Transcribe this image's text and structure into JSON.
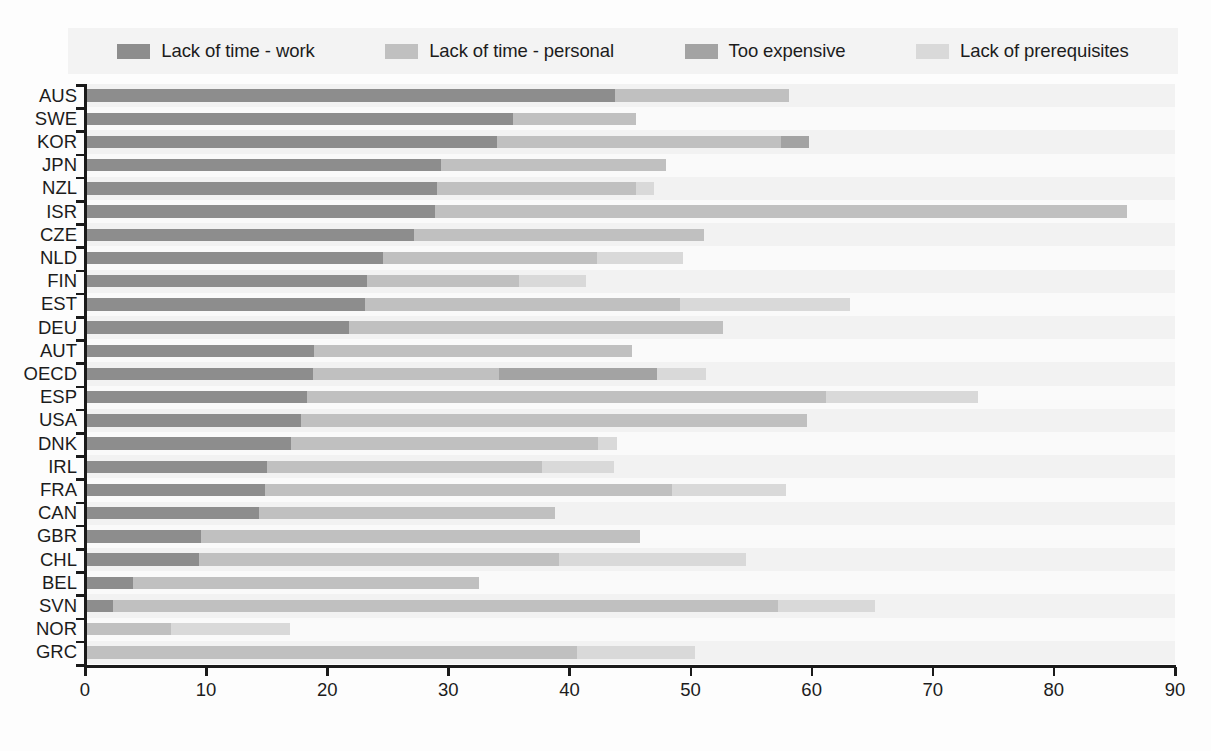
{
  "legend": {
    "items": [
      {
        "label": "Lack of time - work",
        "color": "#8d8d8d",
        "icon": "legend-swatch-icon"
      },
      {
        "label": "Lack of time - personal",
        "color": "#c0c0c0",
        "icon": "legend-swatch-icon"
      },
      {
        "label": "Too expensive",
        "color": "#a3a3a3",
        "icon": "legend-swatch-icon"
      },
      {
        "label": "Lack of prerequisites",
        "color": "#d9d9d9",
        "icon": "legend-swatch-icon"
      }
    ]
  },
  "axes": {
    "x_ticks": [
      "0",
      "10",
      "20",
      "30",
      "40",
      "50",
      "60",
      "70",
      "80",
      "90"
    ],
    "x_min": 0,
    "x_max": 90
  },
  "chart_data": {
    "type": "bar",
    "orientation": "horizontal",
    "stacked": true,
    "title": "",
    "xlabel": "",
    "ylabel": "",
    "xlim": [
      0,
      90
    ],
    "grid": false,
    "legend_position": "top",
    "categories": [
      "AUS",
      "SWE",
      "KOR",
      "JPN",
      "NZL",
      "ISR",
      "CZE",
      "NLD",
      "FIN",
      "EST",
      "DEU",
      "AUT",
      "OECD",
      "ESP",
      "USA",
      "DNK",
      "IRL",
      "FRA",
      "CAN",
      "GBR",
      "CHL",
      "BEL",
      "SVN",
      "NOR",
      "GRC"
    ],
    "series": [
      {
        "name": "Lack of time - work",
        "color": "#8d8d8d",
        "values": [
          43.8,
          35.3,
          34.0,
          29.4,
          29.1,
          28.9,
          27.2,
          24.6,
          23.3,
          23.1,
          21.8,
          18.9,
          18.8,
          18.3,
          17.8,
          17.0,
          15.0,
          14.9,
          14.4,
          9.6,
          9.4,
          4.0,
          2.3,
          0.0,
          0.0
        ]
      },
      {
        "name": "Lack of time - personal",
        "color": "#c0c0c0",
        "values": [
          14.3,
          10.2,
          23.5,
          18.6,
          16.4,
          57.1,
          23.9,
          17.7,
          12.5,
          26.0,
          30.9,
          26.3,
          15.4,
          42.9,
          41.8,
          25.4,
          22.7,
          33.6,
          24.4,
          36.2,
          29.7,
          28.5,
          54.9,
          7.1,
          40.6
        ]
      },
      {
        "name": "Too expensive",
        "color": "#a3a3a3",
        "values": [
          0.0,
          0.0,
          2.3,
          0.0,
          0.0,
          0.0,
          0.0,
          0.0,
          0.0,
          0.0,
          0.0,
          0.0,
          13.0,
          0.0,
          0.0,
          0.0,
          0.0,
          0.0,
          0.0,
          0.0,
          0.0,
          0.0,
          0.0,
          0.0,
          0.0
        ]
      },
      {
        "name": "Lack of prerequisites",
        "color": "#d9d9d9",
        "values": [
          0.0,
          0.0,
          0.0,
          0.0,
          1.5,
          0.0,
          0.0,
          7.1,
          5.6,
          14.1,
          0.0,
          0.0,
          4.1,
          12.5,
          0.0,
          1.5,
          6.0,
          9.4,
          0.0,
          0.0,
          15.5,
          0.0,
          8.0,
          9.8,
          9.8
        ]
      }
    ],
    "totals": [
      58.1,
      45.5,
      59.8,
      48.0,
      47.0,
      86.0,
      51.1,
      49.4,
      41.4,
      63.2,
      52.7,
      45.2,
      51.3,
      73.7,
      59.6,
      43.9,
      43.7,
      57.9,
      38.8,
      45.8,
      54.6,
      32.5,
      65.2,
      16.9,
      50.4
    ]
  }
}
